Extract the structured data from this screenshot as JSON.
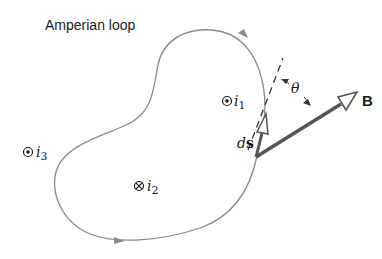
{
  "title": "Amperian loop",
  "loop": {
    "label": "Amperian loop",
    "stroke_color": "#8a8a8a",
    "arrow_color": "#8a8a8a",
    "direction": "counterclockwise"
  },
  "currents": [
    {
      "name": "i",
      "subscript": "1",
      "symbol": "out-of-page",
      "glyph": "⊙",
      "inside_loop": true
    },
    {
      "name": "i",
      "subscript": "2",
      "symbol": "into-page",
      "glyph": "⊗",
      "inside_loop": true
    },
    {
      "name": "i",
      "subscript": "3",
      "symbol": "out-of-page",
      "glyph": "⊙",
      "inside_loop": false
    }
  ],
  "vectors": {
    "ds": {
      "label_italic": "d",
      "label_bold": "s",
      "color": "#555555"
    },
    "B": {
      "label": "B",
      "color": "#555555"
    },
    "angle": {
      "label": "θ"
    }
  }
}
